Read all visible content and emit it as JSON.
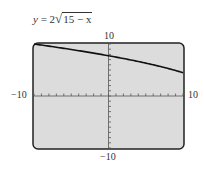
{
  "chart_data": {
    "type": "line",
    "function": "y = 2*sqrt(15 - x)",
    "xlim": [
      -10,
      10
    ],
    "ylim": [
      -10,
      10
    ],
    "xscale": 1,
    "yscale": 1,
    "grid": false,
    "tick_labels": {
      "x_min": "−10",
      "x_max": "10",
      "y_min": "−10",
      "y_max": "10"
    },
    "series": [
      {
        "name": "y = 2√(15 − x)",
        "x": [
          -10,
          -8,
          -6,
          -4,
          -2,
          0,
          2,
          4,
          6,
          8,
          10
        ],
        "y": [
          10.0,
          9.59,
          9.17,
          8.72,
          8.25,
          7.75,
          7.21,
          6.63,
          6.0,
          5.29,
          4.47
        ]
      }
    ],
    "background_color": "#dcdcdc",
    "curve_color": "#111111"
  },
  "labels": {
    "equation_prefix": "y = 2",
    "equation_radicand": "15 − x",
    "x_min": "−10",
    "x_max": "10",
    "y_min": "−10",
    "y_max": "10"
  }
}
